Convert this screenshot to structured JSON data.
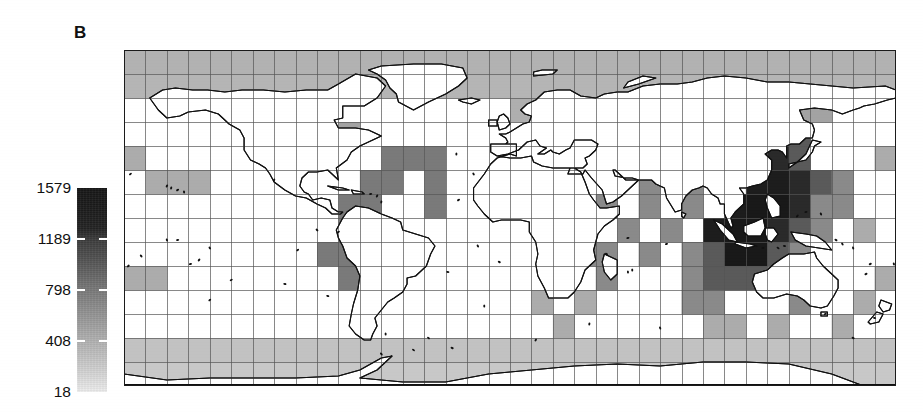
{
  "figure": {
    "panel_label": "B",
    "type": "choropleth-map"
  },
  "colorbar": {
    "name": "species-richness-colorbar",
    "orientation": "vertical",
    "min_value": 18,
    "max_value": 1579,
    "ticks": [
      {
        "label": "1579",
        "value": 1579
      },
      {
        "label": "1189",
        "value": 1189
      },
      {
        "label": "798",
        "value": 798
      },
      {
        "label": "408",
        "value": 408
      },
      {
        "label": "18",
        "value": 18
      }
    ],
    "ramp_dark_hex": "#171717",
    "ramp_light_hex": "#ededed"
  },
  "map": {
    "name": "world-grid-map",
    "projection": "equirectangular",
    "land_fill_hex": "#ffffff",
    "coastline_hex": "#111111",
    "grid_line_hex": "#555555",
    "nodata_fill_hex": "#ffffff",
    "cols": 36,
    "rows": 14,
    "lon_min": -180,
    "lon_max": 180,
    "lat_min": -78,
    "lat_max": 90
  },
  "chart_data": {
    "type": "heatmap",
    "title": "",
    "xlabel": "",
    "ylabel": "",
    "colorbar_label": "",
    "vmin": 18,
    "vmax": 1579,
    "cmap": "grayscale-inverted",
    "cols": 36,
    "rows": 14,
    "legend_position": "left",
    "grid": true,
    "tick_labels": [
      "1579",
      "1189",
      "798",
      "408",
      "18"
    ],
    "tick_values": [
      1579,
      1189,
      798,
      408,
      18
    ],
    "null_value": null,
    "note": "values are per-cell marine species richness; null = no data (white cell)",
    "values": [
      [
        320,
        320,
        320,
        320,
        320,
        320,
        320,
        320,
        320,
        320,
        320,
        320,
        320,
        320,
        320,
        320,
        320,
        320,
        320,
        320,
        320,
        320,
        320,
        320,
        320,
        320,
        320,
        320,
        320,
        320,
        320,
        320,
        320,
        320,
        320,
        320
      ],
      [
        300,
        300,
        300,
        300,
        300,
        300,
        300,
        300,
        300,
        300,
        300,
        300,
        300,
        300,
        300,
        300,
        300,
        300,
        300,
        300,
        300,
        300,
        300,
        300,
        300,
        300,
        300,
        300,
        300,
        300,
        300,
        300,
        300,
        300,
        300,
        300
      ],
      [
        null,
        null,
        null,
        null,
        null,
        null,
        null,
        null,
        null,
        null,
        null,
        null,
        null,
        null,
        null,
        null,
        null,
        null,
        340,
        340,
        null,
        null,
        null,
        null,
        null,
        null,
        null,
        null,
        null,
        null,
        null,
        420,
        420,
        null,
        null,
        null
      ],
      [
        null,
        null,
        null,
        null,
        null,
        null,
        null,
        null,
        null,
        null,
        420,
        null,
        null,
        null,
        null,
        null,
        null,
        null,
        null,
        null,
        null,
        null,
        null,
        null,
        null,
        null,
        null,
        null,
        null,
        null,
        980,
        980,
        null,
        null,
        null,
        null
      ],
      [
        360,
        null,
        null,
        null,
        null,
        null,
        null,
        null,
        null,
        null,
        null,
        null,
        720,
        720,
        720,
        null,
        null,
        null,
        null,
        null,
        null,
        null,
        null,
        null,
        null,
        null,
        null,
        null,
        null,
        1400,
        1400,
        980,
        null,
        null,
        null,
        360
      ],
      [
        null,
        360,
        360,
        360,
        null,
        null,
        null,
        null,
        null,
        null,
        null,
        720,
        720,
        null,
        720,
        null,
        null,
        null,
        null,
        null,
        null,
        null,
        null,
        null,
        600,
        null,
        600,
        null,
        null,
        1520,
        1520,
        1400,
        980,
        600,
        null,
        null
      ],
      [
        null,
        null,
        null,
        null,
        null,
        null,
        null,
        null,
        null,
        null,
        720,
        720,
        null,
        null,
        720,
        null,
        null,
        null,
        null,
        null,
        null,
        null,
        600,
        null,
        600,
        null,
        600,
        null,
        1520,
        1560,
        1560,
        1400,
        600,
        600,
        null,
        null
      ],
      [
        null,
        null,
        null,
        null,
        null,
        null,
        null,
        null,
        null,
        null,
        720,
        null,
        null,
        null,
        null,
        null,
        null,
        null,
        null,
        null,
        null,
        600,
        null,
        600,
        null,
        600,
        null,
        1520,
        1560,
        1560,
        1400,
        980,
        600,
        null,
        360,
        null
      ],
      [
        null,
        null,
        null,
        null,
        null,
        null,
        null,
        null,
        null,
        720,
        720,
        null,
        null,
        null,
        null,
        null,
        null,
        null,
        null,
        null,
        null,
        600,
        600,
        null,
        600,
        null,
        600,
        980,
        1560,
        1560,
        980,
        600,
        null,
        null,
        null,
        null
      ],
      [
        360,
        360,
        null,
        null,
        null,
        null,
        null,
        null,
        null,
        null,
        720,
        null,
        null,
        null,
        null,
        null,
        null,
        null,
        null,
        null,
        360,
        null,
        600,
        null,
        null,
        null,
        600,
        980,
        980,
        980,
        600,
        null,
        null,
        null,
        null,
        360
      ],
      [
        null,
        null,
        null,
        null,
        null,
        null,
        null,
        null,
        null,
        null,
        null,
        null,
        null,
        null,
        null,
        null,
        null,
        null,
        null,
        360,
        null,
        360,
        null,
        null,
        null,
        null,
        600,
        600,
        null,
        null,
        null,
        600,
        null,
        null,
        360,
        null
      ],
      [
        null,
        null,
        null,
        null,
        null,
        null,
        null,
        null,
        null,
        null,
        null,
        null,
        null,
        null,
        null,
        null,
        null,
        null,
        null,
        null,
        360,
        null,
        null,
        null,
        null,
        null,
        null,
        360,
        360,
        null,
        360,
        null,
        null,
        360,
        null,
        null
      ],
      [
        220,
        220,
        220,
        220,
        220,
        220,
        220,
        220,
        220,
        220,
        220,
        220,
        220,
        220,
        220,
        220,
        220,
        220,
        220,
        220,
        220,
        220,
        220,
        220,
        220,
        220,
        220,
        220,
        220,
        220,
        220,
        220,
        220,
        220,
        220,
        220
      ],
      [
        180,
        180,
        180,
        180,
        180,
        180,
        180,
        180,
        180,
        180,
        180,
        180,
        180,
        180,
        180,
        180,
        180,
        180,
        180,
        180,
        180,
        180,
        180,
        180,
        180,
        180,
        180,
        180,
        180,
        180,
        180,
        180,
        180,
        180,
        180,
        180
      ]
    ]
  }
}
